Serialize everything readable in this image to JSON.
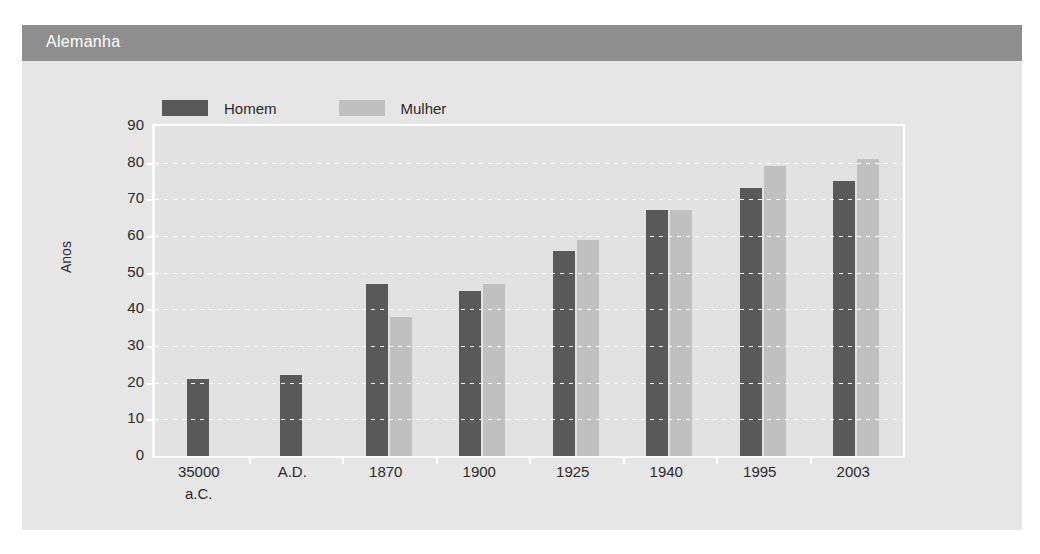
{
  "header": {
    "title": "Alemanha",
    "band_color": "#8e8e8e",
    "text_color": "#ffffff"
  },
  "panel": {
    "background": "#e6e6e6"
  },
  "chart_data": {
    "type": "bar",
    "title": "Alemanha",
    "xlabel": "",
    "ylabel": "Anos",
    "ylim": [
      0,
      90
    ],
    "ytick_step": 10,
    "yticks": [
      0,
      10,
      20,
      30,
      40,
      50,
      60,
      70,
      80,
      90
    ],
    "grid": true,
    "legend_position": "top-left",
    "categories": [
      "35000 a.C.",
      "A.D.",
      "1870",
      "1900",
      "1925",
      "1940",
      "1995",
      "2003"
    ],
    "category_lines": [
      [
        "35000",
        "a.C."
      ],
      [
        "A.D."
      ],
      [
        "1870"
      ],
      [
        "1900"
      ],
      [
        "1925"
      ],
      [
        "1940"
      ],
      [
        "1995"
      ],
      [
        "2003"
      ]
    ],
    "series": [
      {
        "name": "Homem",
        "color": "#595959",
        "values": [
          21,
          22,
          47,
          45,
          56,
          67,
          73,
          75
        ]
      },
      {
        "name": "Mulher",
        "color": "#c0c0c0",
        "values": [
          null,
          null,
          38,
          47,
          59,
          67,
          79,
          81
        ]
      }
    ],
    "plot_background": "#e2e2e2",
    "gridline_color": "#ffffff"
  }
}
